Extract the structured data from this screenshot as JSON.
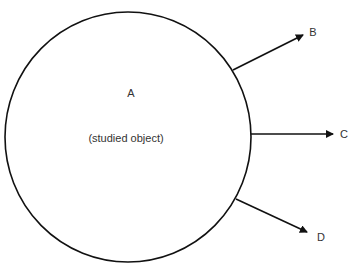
{
  "diagram": {
    "object": {
      "label": "A",
      "caption": "(studied object)"
    },
    "outputs": [
      {
        "label": "B"
      },
      {
        "label": "C"
      },
      {
        "label": "D"
      }
    ],
    "colors": {
      "stroke": "#111111",
      "text": "#333333"
    }
  }
}
